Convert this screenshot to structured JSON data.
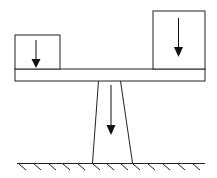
{
  "diagram": {
    "stroke_color": "#222222",
    "fill_color": "#ffffff",
    "arrow_color": "#111111",
    "elements": {
      "left_load": {
        "x": 15,
        "y": 35,
        "w": 45,
        "h": 34,
        "arrow": {
          "x": 36,
          "y1": 40,
          "y2": 68
        }
      },
      "right_load": {
        "x": 153,
        "y": 11,
        "w": 52,
        "h": 58,
        "arrow": {
          "x": 178,
          "y1": 18,
          "y2": 57
        }
      },
      "beam": {
        "x": 15,
        "y": 69,
        "w": 190,
        "h": 12
      },
      "pillar": {
        "top_left": 98,
        "top_right": 121,
        "bottom_left": 92,
        "bottom_right": 133,
        "top_y": 81,
        "bottom_y": 163,
        "arrow": {
          "x": 111,
          "y1": 85,
          "y2": 135
        }
      },
      "ground": {
        "y": 163,
        "x1": 17,
        "x2": 205,
        "hatch_count": 13
      }
    }
  }
}
